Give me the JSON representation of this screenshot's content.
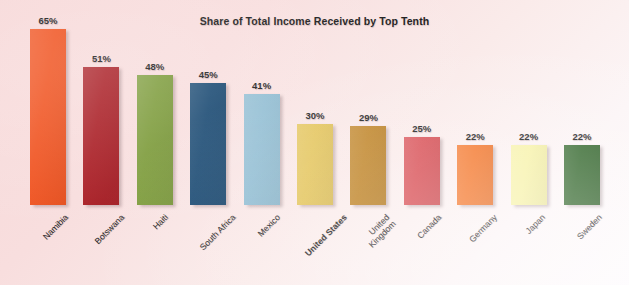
{
  "chart_data": {
    "type": "bar",
    "title": "Share of Total Income Received by Top Tenth",
    "xlabel": "",
    "ylabel": "",
    "ylim": [
      0,
      70
    ],
    "grid": false,
    "legend": "none",
    "value_suffix": "%",
    "categories": [
      "Namibia",
      "Botswana",
      "Haiti",
      "South Africa",
      "Mexico",
      "United States",
      "United Kingdom",
      "Canada",
      "Germany",
      "Japan",
      "Sweden"
    ],
    "values": [
      65,
      51,
      48,
      45,
      41,
      30,
      29,
      25,
      22,
      22,
      22
    ],
    "value_labels": [
      "65%",
      "51%",
      "48%",
      "45%",
      "41%",
      "30%",
      "29%",
      "25%",
      "22%",
      "22%",
      "22%"
    ],
    "colors": [
      "#f0521f",
      "#a91c23",
      "#7b9a38",
      "#14456f",
      "#8fbcd2",
      "#e3c357",
      "#be8122",
      "#d84c52",
      "#f4762a",
      "#f7f2a8",
      "#2e6327"
    ],
    "bars": [
      {
        "category": "Namibia",
        "label_line2": "",
        "value": 65,
        "value_label": "65%",
        "color": "#f0521f",
        "highlight": false
      },
      {
        "category": "Botswana",
        "label_line2": "",
        "value": 51,
        "value_label": "51%",
        "color": "#a91c23",
        "highlight": false
      },
      {
        "category": "Haiti",
        "label_line2": "",
        "value": 48,
        "value_label": "48%",
        "color": "#7b9a38",
        "highlight": false
      },
      {
        "category": "South Africa",
        "label_line2": "",
        "value": 45,
        "value_label": "45%",
        "color": "#14456f",
        "highlight": false
      },
      {
        "category": "Mexico",
        "label_line2": "",
        "value": 41,
        "value_label": "41%",
        "color": "#8fbcd2",
        "highlight": false
      },
      {
        "category": "United States",
        "label_line2": "",
        "value": 30,
        "value_label": "30%",
        "color": "#e3c357",
        "highlight": true
      },
      {
        "category": "United",
        "label_line2": "Kingdom",
        "value": 29,
        "value_label": "29%",
        "color": "#be8122",
        "highlight": false
      },
      {
        "category": "Canada",
        "label_line2": "",
        "value": 25,
        "value_label": "25%",
        "color": "#d84c52",
        "highlight": false
      },
      {
        "category": "Germany",
        "label_line2": "",
        "value": 22,
        "value_label": "22%",
        "color": "#f4762a",
        "highlight": false
      },
      {
        "category": "Japan",
        "label_line2": "",
        "value": 22,
        "value_label": "22%",
        "color": "#f7f2a8",
        "highlight": false
      },
      {
        "category": "Sweden",
        "label_line2": "",
        "value": 22,
        "value_label": "22%",
        "color": "#2e6327",
        "highlight": false
      }
    ]
  },
  "style": {
    "background_start": "#f7d9d9",
    "background_end": "#fdfbfd",
    "text_color": "#1c1c1c"
  }
}
